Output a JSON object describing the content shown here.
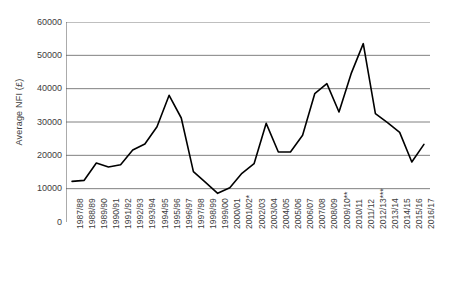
{
  "chart_data": {
    "type": "line",
    "title": "",
    "subtitle": "",
    "xlabel": "",
    "ylabel": "Average NFI (£)",
    "ylim": [
      0,
      60000
    ],
    "y_ticks": [
      0,
      10000,
      20000,
      30000,
      40000,
      50000,
      60000
    ],
    "y_tick_labels": [
      "0",
      "10000",
      "20000",
      "30000",
      "40000",
      "50000",
      "60000"
    ],
    "grid": true,
    "grid_axis": "y",
    "legend": false,
    "legend_position": "none",
    "line_color": "#000000",
    "grid_color": "#808080",
    "axis_color": "#595959",
    "categories": [
      "1987/88",
      "1988/89",
      "1989/90",
      "1990/91",
      "1991/92",
      "1992/93",
      "1993/94",
      "1994/95",
      "1995/96",
      "1996/97",
      "1997/98",
      "1998/99",
      "1999/00",
      "2000/01",
      "2001/02*",
      "2002/03",
      "2003/04",
      "2004/05",
      "2005/06",
      "2006/07",
      "2007/08",
      "2008/09",
      "2009/10**",
      "2010/11",
      "2011/12",
      "2012/13***",
      "2013/14",
      "2014/15",
      "2015/16",
      "2016/17"
    ],
    "values": [
      12200,
      12500,
      17700,
      16500,
      17200,
      21600,
      23400,
      28600,
      38000,
      31200,
      15100,
      11900,
      8600,
      10300,
      14600,
      17500,
      29600,
      21000,
      21000,
      26000,
      38500,
      41500,
      33000,
      44500,
      53500,
      32500,
      29800,
      26900,
      18000,
      23300
    ],
    "series": [
      {
        "name": "Average NFI",
        "values": [
          12200,
          12500,
          17700,
          16500,
          17200,
          21600,
          23400,
          28600,
          38000,
          31200,
          15100,
          11900,
          8600,
          10300,
          14600,
          17500,
          29600,
          21000,
          21000,
          26000,
          38500,
          41500,
          33000,
          44500,
          53500,
          32500,
          29800,
          26900,
          18000,
          23300
        ]
      }
    ]
  }
}
